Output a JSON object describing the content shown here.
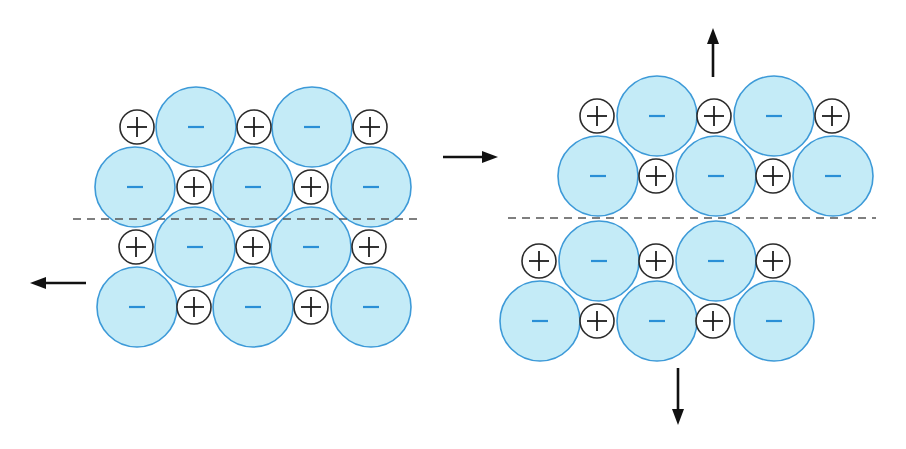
{
  "colors": {
    "anion_fill": "#bfe9f6",
    "anion_stroke": "#3d9ad8",
    "anion_sign": "#2a8fd6",
    "cation_stroke": "#2b2b2b",
    "dashed_line": "#555555",
    "arrow": "#111111"
  },
  "ion_radius": {
    "anion": 40,
    "cation": 17
  },
  "symbols": {
    "anion": "−",
    "cation": "+"
  },
  "panels": [
    {
      "name": "left-lattice-shear",
      "rows": [
        {
          "y": 127,
          "ions": [
            [
              "+",
              137
            ],
            [
              "-",
              196
            ],
            [
              "+",
              254
            ],
            [
              "-",
              312
            ],
            [
              "+",
              370
            ]
          ]
        },
        {
          "y": 187,
          "ions": [
            [
              "-",
              135
            ],
            [
              "+",
              194
            ],
            [
              "-",
              253
            ],
            [
              "+",
              311
            ],
            [
              "-",
              371
            ]
          ]
        },
        {
          "y": 247,
          "ions": [
            [
              "+",
              136
            ],
            [
              "-",
              195
            ],
            [
              "+",
              253
            ],
            [
              "-",
              311
            ],
            [
              "+",
              369
            ]
          ]
        },
        {
          "y": 307,
          "ions": [
            [
              "-",
              137
            ],
            [
              "+",
              194
            ],
            [
              "-",
              253
            ],
            [
              "+",
              311
            ],
            [
              "-",
              371
            ]
          ]
        }
      ],
      "dashed_line": {
        "x1": 73,
        "x2": 420,
        "y": 219
      },
      "arrows": [
        {
          "direction": "left",
          "x1": 86,
          "y1": 283,
          "x2": 30,
          "y2": 283
        }
      ]
    },
    {
      "name": "right-lattice-separated",
      "rows": [
        {
          "y": 116,
          "ions": [
            [
              "+",
              597
            ],
            [
              "-",
              657
            ],
            [
              "+",
              714
            ],
            [
              "-",
              774
            ],
            [
              "+",
              832
            ]
          ]
        },
        {
          "y": 176,
          "ions": [
            [
              "-",
              598
            ],
            [
              "+",
              656
            ],
            [
              "-",
              716
            ],
            [
              "+",
              773
            ],
            [
              "-",
              833
            ]
          ]
        },
        {
          "y": 261,
          "ions": [
            [
              "+",
              539
            ],
            [
              "-",
              599
            ],
            [
              "+",
              656
            ],
            [
              "-",
              716
            ],
            [
              "+",
              773
            ]
          ]
        },
        {
          "y": 321,
          "ions": [
            [
              "-",
              540
            ],
            [
              "+",
              597
            ],
            [
              "-",
              657
            ],
            [
              "+",
              713
            ],
            [
              "-",
              774
            ]
          ]
        }
      ],
      "dashed_line": {
        "x1": 508,
        "x2": 876,
        "y": 218
      },
      "arrows": [
        {
          "direction": "up",
          "x1": 713,
          "y1": 77,
          "x2": 713,
          "y2": 28
        },
        {
          "direction": "down",
          "x1": 678,
          "y1": 368,
          "x2": 678,
          "y2": 425
        }
      ]
    }
  ],
  "transition_arrow": {
    "direction": "right",
    "x1": 443,
    "y1": 157,
    "x2": 498,
    "y2": 157
  }
}
